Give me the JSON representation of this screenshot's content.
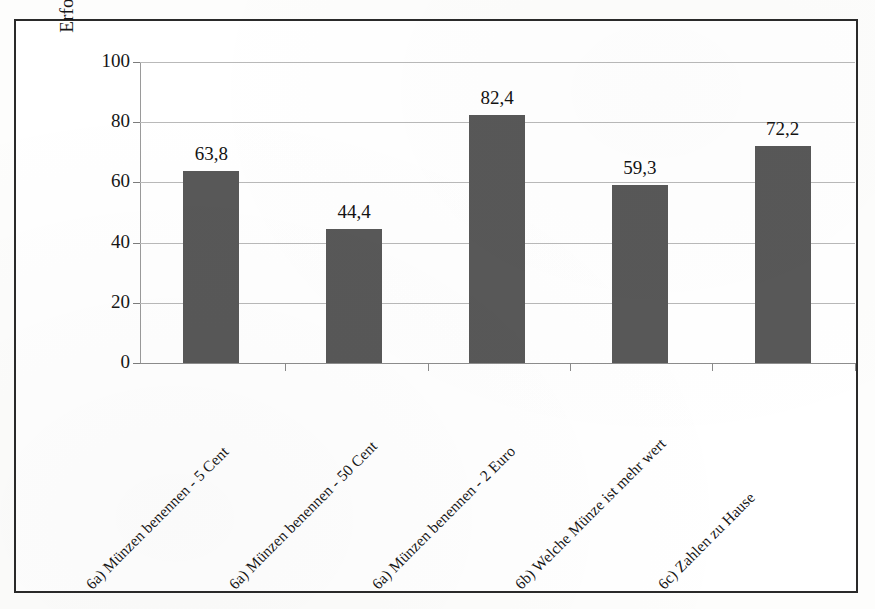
{
  "chart_data": {
    "type": "bar",
    "title": "",
    "xlabel": "",
    "ylabel": "Erfolgsquoten der Kinder in Prozent",
    "ylim": [
      0,
      100
    ],
    "yticks": [
      0,
      20,
      40,
      60,
      80,
      100
    ],
    "ytick_labels": [
      "0",
      "20",
      "40",
      "60",
      "80",
      "100"
    ],
    "grid": true,
    "legend": "none",
    "bar_color": "#585858",
    "categories": [
      "6a) Münzen benennen - 5 Cent",
      "6a) Münzen benennen - 50 Cent",
      "6a) Münzen benennen - 2 Euro",
      "6b) Welche Münze ist mehr wert",
      "6c) Zahlen zu Hause"
    ],
    "values": [
      63.8,
      44.4,
      82.4,
      59.3,
      72.2
    ],
    "value_labels": [
      "63,8",
      "44,4",
      "82,4",
      "59,3",
      "72,2"
    ]
  }
}
